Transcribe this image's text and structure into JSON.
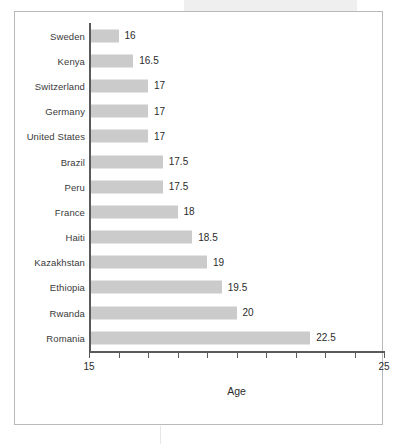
{
  "header_band": {
    "text": ""
  },
  "chart_data": {
    "type": "bar",
    "orientation": "horizontal",
    "title": "",
    "xlabel": "Age",
    "ylabel": "",
    "xlim": [
      15,
      25
    ],
    "xticks": [
      15,
      16,
      17,
      18,
      19,
      20,
      21,
      22,
      23,
      24,
      25
    ],
    "xtick_labels": [
      "15",
      "",
      "",
      "",
      "",
      "",
      "",
      "",
      "",
      "",
      "25"
    ],
    "grid": false,
    "legend": null,
    "bar_color": "#cbcbcb",
    "axis_color": "#5a5a5a",
    "categories": [
      "Sweden",
      "Kenya",
      "Switzerland",
      "Germany",
      "United States",
      "Brazil",
      "Peru",
      "France",
      "Haiti",
      "Kazakhstan",
      "Ethiopia",
      "Rwanda",
      "Romania"
    ],
    "values": [
      16,
      16.5,
      17,
      17,
      17,
      17.5,
      17.5,
      18,
      18.5,
      19,
      19.5,
      20,
      22.5
    ],
    "value_labels": [
      "16",
      "16.5",
      "17",
      "17",
      "17",
      "17.5",
      "17.5",
      "18",
      "18.5",
      "19",
      "19.5",
      "20",
      "22.5"
    ]
  }
}
